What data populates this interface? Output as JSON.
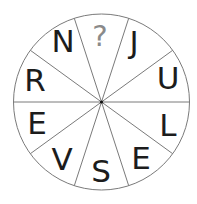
{
  "puzzle": {
    "type": "letter-wheel",
    "sectors_count": 10,
    "center": [
      101.5,
      102
    ],
    "radius": 88,
    "colors": {
      "line": "#7a7a7a",
      "letter": "#1c1c1c",
      "unknown": "#8a8a8a",
      "center_dot": "#111111",
      "background": "#ffffff"
    },
    "sectors": [
      {
        "position": "top",
        "label": "?",
        "unknown": true,
        "x": 100,
        "y": 46
      },
      {
        "position": "top-right",
        "label": "J",
        "x": 134,
        "y": 53
      },
      {
        "position": "right-upper",
        "label": "U",
        "x": 168,
        "y": 89
      },
      {
        "position": "right-lower",
        "label": "L",
        "x": 168,
        "y": 136
      },
      {
        "position": "bottom-right",
        "label": "E",
        "x": 141,
        "y": 169
      },
      {
        "position": "bottom",
        "label": "S",
        "x": 101,
        "y": 182
      },
      {
        "position": "bottom-left",
        "label": "V",
        "x": 62,
        "y": 170
      },
      {
        "position": "left-lower",
        "label": "E",
        "x": 37,
        "y": 134
      },
      {
        "position": "left-upper",
        "label": "R",
        "x": 35,
        "y": 91
      },
      {
        "position": "top-left",
        "label": "N",
        "x": 63,
        "y": 52
      }
    ]
  }
}
